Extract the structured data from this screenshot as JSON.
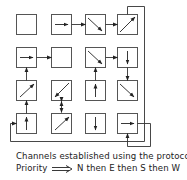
{
  "diagram": {
    "type": "mesh-channel-routing",
    "grid": {
      "rows": 4,
      "cols": 4
    },
    "cells": [
      [
        {
          "dir": "none"
        },
        {
          "dir": "E"
        },
        {
          "dir": "SE"
        },
        {
          "dir": "NE"
        }
      ],
      [
        {
          "dir": "E"
        },
        {
          "dir": "none"
        },
        {
          "dir": "SE"
        },
        {
          "dir": "S"
        }
      ],
      [
        {
          "dir": "NE"
        },
        {
          "dir": "SW"
        },
        {
          "dir": "N"
        },
        {
          "dir": "SE"
        }
      ],
      [
        {
          "dir": "N"
        },
        {
          "dir": "NE"
        },
        {
          "dir": "S"
        },
        {
          "dir": "E"
        }
      ]
    ],
    "connections": [
      "r0c1->r0c2",
      "r0c2->r0c3",
      "r1c0->r1c1",
      "r1c2->r1c3",
      "r2c0->r1c0",
      "r2c2->r1c2",
      "r1c3->r2c3",
      "r3c0->r2c0",
      "r2c1<->r3c1",
      "r0c3->wrap->r3c0",
      "r3c3->loop->r3c3"
    ]
  },
  "caption": {
    "line1": "Channels established using the protocol",
    "line2_prefix": "Priority",
    "line2_suffix": "N then E then S then W"
  }
}
